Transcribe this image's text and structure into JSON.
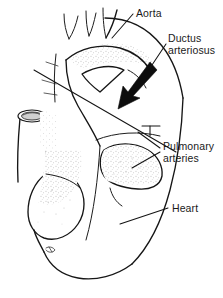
{
  "figure": {
    "background_color": "#ffffff",
    "ink_color": "#161616",
    "width": 223,
    "height": 298
  },
  "labels": {
    "aorta": "Aorta",
    "ductus_line1": "Ductus",
    "ductus_line2": "arteriosus",
    "pulmonary_line1": "Pulmonary",
    "pulmonary_line2": "arteries",
    "heart": "Heart"
  },
  "structures": {
    "aortic_arch": "aortic-arch",
    "brachiocephalic_branches": "arch-branch-vessels",
    "superior_vena_cava": "superior-vena-cava-cut-end",
    "right_atrium": "right-atrial-appendage",
    "pulmonary_trunk": "pulmonary-artery-trunk",
    "ventricle_mass": "ventricular-mass",
    "ductus_arrow": "ductus-arteriosus-arrow"
  }
}
